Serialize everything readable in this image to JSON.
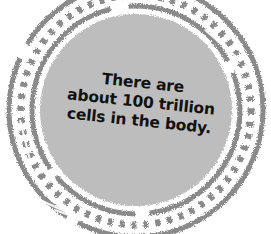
{
  "badge": {
    "lines": [
      "There are",
      "about 100 trillion",
      "cells in the body."
    ],
    "colors": {
      "background": "#ffffff",
      "inner_fill": "#bdbdbd",
      "ring": "#8a8a8a",
      "text": "#111111"
    },
    "style": "distressed circular stamp"
  }
}
